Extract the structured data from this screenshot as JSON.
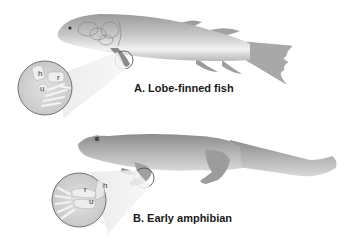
{
  "figure": {
    "panel_a": {
      "caption": "A. Lobe-finned fish",
      "inset_bone_labels": [
        "h",
        "r",
        "u"
      ]
    },
    "panel_b": {
      "caption": "B. Early amphibian",
      "inset_bone_labels": [
        "r",
        "h",
        "u"
      ]
    },
    "colors": {
      "background": "#ffffff",
      "body_shade": "#a8a8a8",
      "inset_fill": "#d4d4d4",
      "outline": "#555555",
      "caption_text": "#1a1a1a"
    }
  }
}
